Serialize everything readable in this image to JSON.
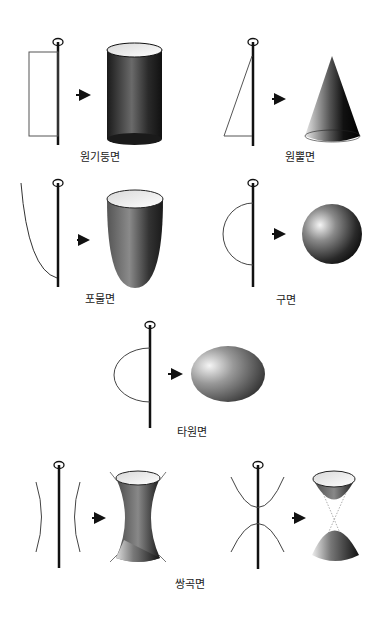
{
  "colors": {
    "line": "#111111",
    "outline": "#555555",
    "background": "#ffffff"
  },
  "surfaces": [
    {
      "id": "cylinder",
      "label": "원기둥면",
      "generator": "rectangle"
    },
    {
      "id": "cone",
      "label": "원뿔면",
      "generator": "right-triangle"
    },
    {
      "id": "paraboloid",
      "label": "포물면",
      "generator": "parabola"
    },
    {
      "id": "sphere",
      "label": "구면",
      "generator": "semicircle"
    },
    {
      "id": "ellipsoid",
      "label": "타원면",
      "generator": "semi-ellipse"
    },
    {
      "id": "hyperboloid",
      "label": "쌍곡면",
      "generator": "hyperbola"
    }
  ]
}
